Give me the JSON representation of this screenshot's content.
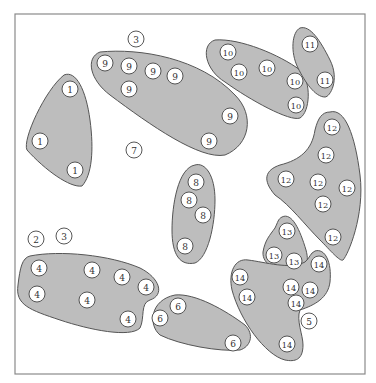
{
  "diagram": {
    "type": "cluster-diagram",
    "frame": {
      "x": 15,
      "y": 14,
      "width": 350,
      "height": 360
    },
    "colors": {
      "cluster_fill": "#bdbdbd",
      "cluster_stroke": "#555555",
      "node_fill": "#ffffff",
      "node_stroke": "#444444",
      "frame_stroke": "#8a8a8a"
    },
    "node_radius": 8,
    "clusters": [
      {
        "id": "1",
        "path": "M 64 75 C 76 70, 86 90, 90 120 C 94 150, 92 175, 82 186 C 70 188, 45 170, 27 150 C 22 140, 45 90, 64 75 Z"
      },
      {
        "id": "9",
        "path": "M 100 52 C 140 48, 200 58, 235 95 C 255 115, 250 145, 225 155 C 200 160, 150 125, 110 95 C 90 80, 85 58, 100 52 Z"
      },
      {
        "id": "10",
        "path": "M 215 40 C 240 38, 280 55, 300 70 C 312 82, 310 112, 300 118 C 290 122, 250 100, 225 82 C 205 70, 200 45, 215 40 Z"
      },
      {
        "id": "11",
        "path": "M 300 28 C 310 25, 320 40, 330 60 C 340 80, 330 97, 325 97 C 315 97, 305 82, 298 68 C 290 52, 292 32, 300 28 Z"
      },
      {
        "id": "12",
        "path": "M 330 112 C 345 108, 355 135, 360 175 C 365 215, 348 255, 343 260 C 340 262, 330 250, 320 240 C 305 225, 290 205, 275 195 C 262 180, 265 170, 280 165 C 300 160, 312 150, 315 130 C 318 118, 322 112, 330 112 Z"
      },
      {
        "id": "8",
        "path": "M 195 165 C 205 162, 215 175, 215 200 C 215 225, 208 258, 195 263 C 180 266, 172 255, 172 230 C 172 205, 178 168, 195 165 Z"
      },
      {
        "id": "13",
        "path": "M 282 217 C 292 212, 300 230, 306 250 C 310 265, 305 272, 293 272 C 278 272, 262 265, 263 252 C 265 240, 270 235, 275 228 C 278 222, 278 219, 282 217 Z"
      },
      {
        "id": "14",
        "path": "M 315 251 C 325 248, 332 262, 330 282 C 328 298, 315 305, 300 310 C 296 320, 303 335, 303 345 C 303 360, 295 362, 285 360 C 265 355, 240 320, 232 290 C 228 272, 235 258, 248 260 C 265 262, 290 270, 305 262 C 310 258, 310 253, 315 251 Z"
      },
      {
        "id": "4",
        "path": "M 30 256 C 60 250, 110 255, 140 268 C 160 278, 165 295, 150 300 C 140 303, 145 318, 140 328 C 130 338, 90 330, 60 320 C 30 310, 15 305, 18 285 C 20 268, 22 258, 30 256 Z"
      },
      {
        "id": "6",
        "path": "M 175 295 C 195 293, 225 310, 245 325 C 255 335, 250 347, 240 350 C 220 352, 180 345, 160 335 C 148 325, 150 300, 175 295 Z"
      }
    ],
    "nodes": [
      {
        "label": "1",
        "x": 70,
        "y": 89,
        "in_cluster": true
      },
      {
        "label": "1",
        "x": 40,
        "y": 141,
        "in_cluster": true
      },
      {
        "label": "1",
        "x": 75,
        "y": 170,
        "in_cluster": true
      },
      {
        "label": "2",
        "x": 36,
        "y": 239,
        "in_cluster": false
      },
      {
        "label": "3",
        "x": 136,
        "y": 39,
        "in_cluster": false
      },
      {
        "label": "3",
        "x": 64,
        "y": 236,
        "in_cluster": false
      },
      {
        "label": "4",
        "x": 39,
        "y": 268,
        "in_cluster": true
      },
      {
        "label": "4",
        "x": 37,
        "y": 294,
        "in_cluster": true
      },
      {
        "label": "4",
        "x": 92,
        "y": 270,
        "in_cluster": true
      },
      {
        "label": "4",
        "x": 122,
        "y": 277,
        "in_cluster": true
      },
      {
        "label": "4",
        "x": 146,
        "y": 287,
        "in_cluster": true
      },
      {
        "label": "4",
        "x": 87,
        "y": 300,
        "in_cluster": true
      },
      {
        "label": "4",
        "x": 128,
        "y": 319,
        "in_cluster": true
      },
      {
        "label": "5",
        "x": 309,
        "y": 321,
        "in_cluster": false
      },
      {
        "label": "6",
        "x": 178,
        "y": 306,
        "in_cluster": true
      },
      {
        "label": "6",
        "x": 160,
        "y": 318,
        "in_cluster": true
      },
      {
        "label": "6",
        "x": 233,
        "y": 343,
        "in_cluster": true
      },
      {
        "label": "7",
        "x": 134,
        "y": 150,
        "in_cluster": false
      },
      {
        "label": "8",
        "x": 196,
        "y": 182,
        "in_cluster": true
      },
      {
        "label": "8",
        "x": 189,
        "y": 200,
        "in_cluster": true
      },
      {
        "label": "8",
        "x": 203,
        "y": 215,
        "in_cluster": true
      },
      {
        "label": "8",
        "x": 185,
        "y": 246,
        "in_cluster": true
      },
      {
        "label": "9",
        "x": 105,
        "y": 63,
        "in_cluster": true
      },
      {
        "label": "9",
        "x": 129,
        "y": 66,
        "in_cluster": true
      },
      {
        "label": "9",
        "x": 153,
        "y": 71,
        "in_cluster": true
      },
      {
        "label": "9",
        "x": 175,
        "y": 76,
        "in_cluster": true
      },
      {
        "label": "9",
        "x": 129,
        "y": 89,
        "in_cluster": true
      },
      {
        "label": "9",
        "x": 230,
        "y": 116,
        "in_cluster": true
      },
      {
        "label": "9",
        "x": 209,
        "y": 141,
        "in_cluster": true
      },
      {
        "label": "10",
        "x": 228,
        "y": 52,
        "in_cluster": true
      },
      {
        "label": "10",
        "x": 239,
        "y": 72,
        "in_cluster": true
      },
      {
        "label": "10",
        "x": 267,
        "y": 68,
        "in_cluster": true
      },
      {
        "label": "10",
        "x": 295,
        "y": 81,
        "in_cluster": true
      },
      {
        "label": "10",
        "x": 296,
        "y": 105,
        "in_cluster": true
      },
      {
        "label": "11",
        "x": 310,
        "y": 44,
        "in_cluster": true
      },
      {
        "label": "11",
        "x": 325,
        "y": 80,
        "in_cluster": true
      },
      {
        "label": "12",
        "x": 332,
        "y": 127,
        "in_cluster": true
      },
      {
        "label": "12",
        "x": 326,
        "y": 155,
        "in_cluster": true
      },
      {
        "label": "12",
        "x": 286,
        "y": 179,
        "in_cluster": true
      },
      {
        "label": "12",
        "x": 318,
        "y": 182,
        "in_cluster": true
      },
      {
        "label": "12",
        "x": 347,
        "y": 188,
        "in_cluster": true
      },
      {
        "label": "12",
        "x": 323,
        "y": 204,
        "in_cluster": true
      },
      {
        "label": "12",
        "x": 333,
        "y": 237,
        "in_cluster": true
      },
      {
        "label": "13",
        "x": 287,
        "y": 231,
        "in_cluster": true
      },
      {
        "label": "13",
        "x": 274,
        "y": 255,
        "in_cluster": true
      },
      {
        "label": "13",
        "x": 294,
        "y": 261,
        "in_cluster": true
      },
      {
        "label": "14",
        "x": 319,
        "y": 264,
        "in_cluster": true
      },
      {
        "label": "14",
        "x": 240,
        "y": 277,
        "in_cluster": true
      },
      {
        "label": "14",
        "x": 247,
        "y": 297,
        "in_cluster": true
      },
      {
        "label": "14",
        "x": 291,
        "y": 287,
        "in_cluster": true
      },
      {
        "label": "14",
        "x": 310,
        "y": 290,
        "in_cluster": true
      },
      {
        "label": "14",
        "x": 296,
        "y": 303,
        "in_cluster": true
      },
      {
        "label": "14",
        "x": 287,
        "y": 344,
        "in_cluster": true
      }
    ]
  }
}
